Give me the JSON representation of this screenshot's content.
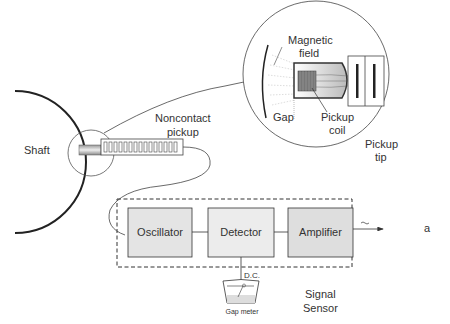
{
  "diagram": {
    "shaft": {
      "label": "Shaft"
    },
    "pickup": {
      "label_line1": "Noncontact",
      "label_line2": "pickup"
    },
    "detail": {
      "magnetic_field_line1": "Magnetic",
      "magnetic_field_line2": "field",
      "gap": "Gap",
      "pickup_coil_line1": "Pickup",
      "pickup_coil_line2": "coil",
      "pickup_tip_line1": "Pickup",
      "pickup_tip_line2": "tip"
    },
    "blocks": [
      {
        "label": "Oscillator"
      },
      {
        "label": "Detector"
      },
      {
        "label": "Amplifier"
      }
    ],
    "dc_label": "D.C.",
    "gap_meter": "Gap meter",
    "signal_sensor_line1": "Signal",
    "signal_sensor_line2": "Sensor",
    "output_symbol": "~",
    "output_label": "a",
    "colors": {
      "block_fill": "#e4e4e4",
      "line": "#333333"
    }
  }
}
